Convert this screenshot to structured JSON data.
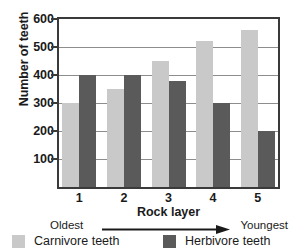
{
  "chart_data": {
    "type": "bar",
    "title": "",
    "xlabel": "Rock layer",
    "ylabel": "Number of teeth",
    "categories": [
      "1",
      "2",
      "3",
      "4",
      "5"
    ],
    "series": [
      {
        "name": "Carnivore teeth",
        "color": "#c9c9c9",
        "values": [
          300,
          350,
          450,
          520,
          560
        ]
      },
      {
        "name": "Herbivore teeth",
        "color": "#5a5a5a",
        "values": [
          400,
          400,
          378,
          300,
          200
        ]
      }
    ],
    "ylim": [
      0,
      600
    ],
    "yticks": [
      100,
      200,
      300,
      400,
      500,
      600
    ],
    "ytick_labels": [
      "100",
      "200",
      "300",
      "400",
      "500",
      "600"
    ],
    "grid": true,
    "legend_position": "bottom",
    "annotations": {
      "axis_direction_left": "Oldest",
      "axis_direction_right": "Youngest",
      "axis_direction_arrow": "arrow-right-icon"
    }
  },
  "axes": {
    "y_title": "Number of teeth",
    "x_title": "Rock layer"
  },
  "legend": {
    "items": [
      {
        "label": "Carnivore teeth",
        "swatch": "carnivore-swatch-icon"
      },
      {
        "label": "Herbivore teeth",
        "swatch": "herbivore-swatch-icon"
      }
    ]
  },
  "age_scale": {
    "left_label": "Oldest",
    "right_label": "Youngest"
  }
}
